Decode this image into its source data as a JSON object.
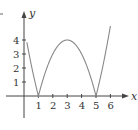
{
  "chart_data": {
    "type": "line",
    "title": "",
    "xlabel": "x",
    "ylabel": "y",
    "xlim": [
      -0.5,
      6.5
    ],
    "ylim": [
      -1.5,
      4.8
    ],
    "x_ticks": [
      "1",
      "2",
      "3",
      "4",
      "5",
      "6"
    ],
    "y_ticks": [
      "1",
      "2",
      "3",
      "4"
    ],
    "grid": false,
    "legend": null,
    "series": [
      {
        "name": "y = |x^2 - 6x + 5|",
        "x": [
          0,
          0.5,
          1,
          1.5,
          2,
          2.5,
          3,
          3.5,
          4,
          4.5,
          5,
          5.5,
          6
        ],
        "values": [
          5,
          2.25,
          0,
          1.75,
          3,
          3.75,
          4,
          3.75,
          3,
          1.75,
          0,
          2.75,
          5
        ]
      }
    ],
    "visible_range_note": "curve shown from about y=4 at x=0 down to 0 at x=1, up to 4 at x=3, down to 0 at x=5, up to 4 near x=6"
  },
  "labels": {
    "x": "x",
    "y": "y",
    "xt1": "1",
    "xt2": "2",
    "xt3": "3",
    "xt4": "4",
    "xt5": "5",
    "xt6": "6",
    "yt1": "1",
    "yt2": "2",
    "yt3": "3",
    "yt4": "4"
  },
  "colors": {
    "axis": "#444444",
    "curve": "#888888",
    "text": "#333333"
  }
}
